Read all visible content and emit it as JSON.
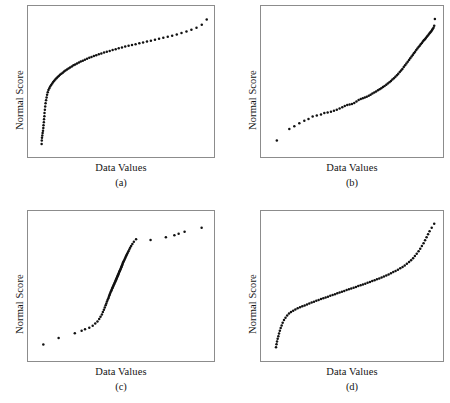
{
  "figure": {
    "background": "#ffffff",
    "point_color": "#111111",
    "frame_color": "#8c8c8c",
    "point_radius": 1.25
  },
  "panels": [
    {
      "id": "a",
      "caption": "(a)",
      "xlabel": "Data Values",
      "ylabel": "Normal Score"
    },
    {
      "id": "b",
      "caption": "(b)",
      "xlabel": "Data Values",
      "ylabel": "Normal Score"
    },
    {
      "id": "c",
      "caption": "(c)",
      "xlabel": "Data Values",
      "ylabel": "Normal Score"
    },
    {
      "id": "d",
      "caption": "(d)",
      "xlabel": "Data Values",
      "ylabel": "Normal Score"
    }
  ],
  "chart_data": [
    {
      "type": "scatter",
      "id": "a",
      "title": "",
      "xlabel": "Data Values",
      "ylabel": "Normal Score",
      "caption": "(a)",
      "grid": false,
      "legend": null,
      "xlim": [
        0,
        1
      ],
      "ylim": [
        0,
        1
      ],
      "shape": "concave-down (right-skewed distribution)",
      "x": [
        0.02,
        0.021,
        0.022,
        0.024,
        0.026,
        0.028,
        0.03,
        0.031,
        0.033,
        0.034,
        0.036,
        0.037,
        0.039,
        0.041,
        0.043,
        0.046,
        0.049,
        0.052,
        0.056,
        0.06,
        0.065,
        0.07,
        0.076,
        0.082,
        0.088,
        0.094,
        0.1,
        0.107,
        0.114,
        0.121,
        0.128,
        0.136,
        0.144,
        0.152,
        0.16,
        0.169,
        0.178,
        0.187,
        0.197,
        0.207,
        0.217,
        0.228,
        0.239,
        0.25,
        0.262,
        0.274,
        0.287,
        0.3,
        0.313,
        0.327,
        0.341,
        0.356,
        0.371,
        0.387,
        0.403,
        0.42,
        0.437,
        0.455,
        0.473,
        0.492,
        0.511,
        0.531,
        0.551,
        0.572,
        0.594,
        0.616,
        0.639,
        0.662,
        0.686,
        0.71,
        0.735,
        0.761,
        0.787,
        0.814,
        0.842,
        0.871,
        0.9,
        0.93,
        0.961,
        0.99
      ],
      "y": [
        0.03,
        0.055,
        0.075,
        0.092,
        0.11,
        0.128,
        0.148,
        0.168,
        0.19,
        0.212,
        0.235,
        0.258,
        0.282,
        0.306,
        0.33,
        0.352,
        0.374,
        0.394,
        0.412,
        0.428,
        0.442,
        0.455,
        0.466,
        0.477,
        0.487,
        0.497,
        0.506,
        0.515,
        0.524,
        0.532,
        0.541,
        0.549,
        0.557,
        0.565,
        0.573,
        0.581,
        0.588,
        0.596,
        0.603,
        0.611,
        0.618,
        0.625,
        0.632,
        0.639,
        0.646,
        0.653,
        0.66,
        0.667,
        0.673,
        0.68,
        0.686,
        0.693,
        0.699,
        0.706,
        0.712,
        0.718,
        0.725,
        0.731,
        0.737,
        0.743,
        0.75,
        0.756,
        0.762,
        0.768,
        0.775,
        0.781,
        0.788,
        0.794,
        0.801,
        0.808,
        0.815,
        0.823,
        0.831,
        0.84,
        0.85,
        0.861,
        0.874,
        0.89,
        0.912,
        0.95
      ]
    },
    {
      "type": "scatter",
      "id": "b",
      "title": "",
      "xlabel": "Data Values",
      "ylabel": "Normal Score",
      "caption": "(b)",
      "grid": false,
      "legend": null,
      "xlim": [
        0,
        1
      ],
      "ylim": [
        0,
        1
      ],
      "shape": "concave-up (left-skewed distribution)",
      "x": [
        0.035,
        0.11,
        0.14,
        0.17,
        0.2,
        0.225,
        0.25,
        0.275,
        0.3,
        0.32,
        0.34,
        0.36,
        0.378,
        0.395,
        0.412,
        0.428,
        0.443,
        0.458,
        0.472,
        0.486,
        0.5,
        0.513,
        0.526,
        0.539,
        0.551,
        0.563,
        0.575,
        0.587,
        0.598,
        0.609,
        0.62,
        0.631,
        0.642,
        0.652,
        0.662,
        0.672,
        0.682,
        0.692,
        0.701,
        0.711,
        0.72,
        0.729,
        0.738,
        0.747,
        0.756,
        0.764,
        0.773,
        0.781,
        0.789,
        0.797,
        0.805,
        0.813,
        0.821,
        0.829,
        0.836,
        0.844,
        0.851,
        0.858,
        0.865,
        0.872,
        0.879,
        0.886,
        0.893,
        0.899,
        0.906,
        0.912,
        0.918,
        0.924,
        0.93,
        0.936,
        0.941,
        0.947,
        0.952,
        0.957,
        0.962,
        0.967,
        0.971,
        0.976,
        0.98,
        0.984
      ],
      "y": [
        0.055,
        0.14,
        0.16,
        0.182,
        0.202,
        0.215,
        0.232,
        0.24,
        0.248,
        0.258,
        0.262,
        0.268,
        0.275,
        0.282,
        0.292,
        0.302,
        0.31,
        0.318,
        0.322,
        0.326,
        0.332,
        0.344,
        0.355,
        0.362,
        0.368,
        0.374,
        0.378,
        0.386,
        0.394,
        0.402,
        0.41,
        0.418,
        0.426,
        0.434,
        0.442,
        0.45,
        0.459,
        0.468,
        0.477,
        0.486,
        0.496,
        0.506,
        0.516,
        0.527,
        0.538,
        0.549,
        0.561,
        0.573,
        0.585,
        0.598,
        0.611,
        0.624,
        0.637,
        0.65,
        0.663,
        0.676,
        0.688,
        0.7,
        0.712,
        0.724,
        0.735,
        0.746,
        0.757,
        0.767,
        0.777,
        0.787,
        0.796,
        0.805,
        0.814,
        0.823,
        0.831,
        0.84,
        0.848,
        0.856,
        0.864,
        0.872,
        0.88,
        0.89,
        0.905,
        0.955
      ]
    },
    {
      "type": "scatter",
      "id": "c",
      "title": "",
      "xlabel": "Data Values",
      "ylabel": "Normal Score",
      "caption": "(c)",
      "grid": false,
      "legend": null,
      "xlim": [
        0,
        1
      ],
      "ylim": [
        0,
        1
      ],
      "shape": "steep S-curve (heavy-tailed / outliers in both tails)",
      "x": [
        0.03,
        0.12,
        0.215,
        0.255,
        0.275,
        0.3,
        0.32,
        0.335,
        0.348,
        0.358,
        0.366,
        0.374,
        0.38,
        0.386,
        0.391,
        0.396,
        0.4,
        0.404,
        0.408,
        0.412,
        0.415,
        0.418,
        0.421,
        0.424,
        0.427,
        0.43,
        0.432,
        0.435,
        0.437,
        0.44,
        0.442,
        0.445,
        0.447,
        0.449,
        0.452,
        0.454,
        0.456,
        0.458,
        0.46,
        0.462,
        0.464,
        0.466,
        0.468,
        0.47,
        0.472,
        0.474,
        0.476,
        0.478,
        0.48,
        0.482,
        0.484,
        0.486,
        0.488,
        0.49,
        0.492,
        0.494,
        0.496,
        0.498,
        0.5,
        0.503,
        0.506,
        0.509,
        0.512,
        0.515,
        0.518,
        0.522,
        0.526,
        0.53,
        0.535,
        0.54,
        0.546,
        0.553,
        0.562,
        0.575,
        0.66,
        0.75,
        0.8,
        0.825,
        0.86,
        0.96
      ],
      "y": [
        0.055,
        0.105,
        0.14,
        0.158,
        0.17,
        0.18,
        0.195,
        0.212,
        0.228,
        0.245,
        0.262,
        0.28,
        0.298,
        0.315,
        0.332,
        0.348,
        0.362,
        0.376,
        0.389,
        0.401,
        0.412,
        0.422,
        0.432,
        0.441,
        0.45,
        0.458,
        0.466,
        0.474,
        0.481,
        0.488,
        0.495,
        0.502,
        0.509,
        0.515,
        0.522,
        0.528,
        0.535,
        0.541,
        0.547,
        0.553,
        0.559,
        0.565,
        0.571,
        0.577,
        0.583,
        0.589,
        0.595,
        0.601,
        0.607,
        0.613,
        0.619,
        0.625,
        0.631,
        0.637,
        0.644,
        0.65,
        0.657,
        0.664,
        0.671,
        0.678,
        0.686,
        0.694,
        0.702,
        0.711,
        0.72,
        0.73,
        0.74,
        0.751,
        0.763,
        0.776,
        0.79,
        0.805,
        0.822,
        0.84,
        0.835,
        0.855,
        0.87,
        0.88,
        0.895,
        0.925
      ]
    },
    {
      "type": "scatter",
      "id": "d",
      "title": "",
      "xlabel": "Data Values",
      "ylabel": "Normal Score",
      "caption": "(d)",
      "grid": false,
      "legend": null,
      "xlim": [
        0,
        1
      ],
      "ylim": [
        0,
        1
      ],
      "shape": "gentle S-curve (light-tailed / short-tailed distribution)",
      "x": [
        0.03,
        0.033,
        0.036,
        0.04,
        0.044,
        0.048,
        0.053,
        0.058,
        0.064,
        0.07,
        0.078,
        0.087,
        0.097,
        0.108,
        0.12,
        0.133,
        0.146,
        0.16,
        0.174,
        0.188,
        0.202,
        0.216,
        0.23,
        0.244,
        0.258,
        0.272,
        0.286,
        0.3,
        0.314,
        0.328,
        0.342,
        0.356,
        0.37,
        0.384,
        0.398,
        0.412,
        0.426,
        0.44,
        0.454,
        0.468,
        0.482,
        0.496,
        0.51,
        0.524,
        0.538,
        0.552,
        0.566,
        0.58,
        0.594,
        0.608,
        0.622,
        0.636,
        0.65,
        0.664,
        0.678,
        0.692,
        0.706,
        0.72,
        0.734,
        0.748,
        0.762,
        0.776,
        0.79,
        0.803,
        0.816,
        0.829,
        0.841,
        0.853,
        0.864,
        0.875,
        0.886,
        0.896,
        0.906,
        0.916,
        0.925,
        0.934,
        0.943,
        0.952,
        0.965,
        0.98
      ],
      "y": [
        0.035,
        0.058,
        0.078,
        0.098,
        0.118,
        0.138,
        0.158,
        0.178,
        0.198,
        0.218,
        0.238,
        0.256,
        0.272,
        0.286,
        0.298,
        0.308,
        0.317,
        0.325,
        0.333,
        0.34,
        0.347,
        0.354,
        0.361,
        0.368,
        0.374,
        0.381,
        0.387,
        0.394,
        0.4,
        0.406,
        0.412,
        0.419,
        0.425,
        0.431,
        0.437,
        0.443,
        0.449,
        0.455,
        0.461,
        0.467,
        0.473,
        0.479,
        0.485,
        0.491,
        0.497,
        0.503,
        0.509,
        0.515,
        0.521,
        0.528,
        0.534,
        0.541,
        0.548,
        0.555,
        0.562,
        0.57,
        0.578,
        0.586,
        0.595,
        0.604,
        0.613,
        0.623,
        0.634,
        0.645,
        0.657,
        0.67,
        0.684,
        0.699,
        0.715,
        0.732,
        0.75,
        0.769,
        0.789,
        0.81,
        0.832,
        0.855,
        0.878,
        0.9,
        0.925,
        0.955
      ]
    }
  ]
}
